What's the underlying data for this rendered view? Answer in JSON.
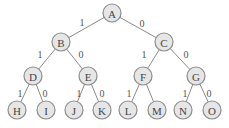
{
  "diagram": {
    "type": "binary-tree",
    "nodes": [
      {
        "id": "A",
        "label": "A",
        "x": 112,
        "y": 13
      },
      {
        "id": "B",
        "label": "B",
        "x": 61,
        "y": 42
      },
      {
        "id": "C",
        "label": "C",
        "x": 164,
        "y": 42
      },
      {
        "id": "D",
        "label": "D",
        "x": 33,
        "y": 76
      },
      {
        "id": "E",
        "label": "E",
        "x": 88,
        "y": 76
      },
      {
        "id": "F",
        "label": "F",
        "x": 143,
        "y": 76
      },
      {
        "id": "G",
        "label": "G",
        "x": 196,
        "y": 76
      },
      {
        "id": "H",
        "label": "H",
        "x": 17,
        "y": 110
      },
      {
        "id": "I",
        "label": "I",
        "x": 46,
        "y": 110
      },
      {
        "id": "J",
        "label": "J",
        "x": 74,
        "y": 110
      },
      {
        "id": "K",
        "label": "K",
        "x": 102,
        "y": 110
      },
      {
        "id": "L",
        "label": "L",
        "x": 128,
        "y": 110
      },
      {
        "id": "M",
        "label": "M",
        "x": 157,
        "y": 110
      },
      {
        "id": "N",
        "label": "N",
        "x": 183,
        "y": 110
      },
      {
        "id": "O",
        "label": "O",
        "x": 212,
        "y": 110
      }
    ],
    "edges": [
      {
        "from": "A",
        "to": "B",
        "label": "1",
        "lx": 82,
        "ly": 22
      },
      {
        "from": "A",
        "to": "C",
        "label": "0",
        "lx": 142,
        "ly": 23
      },
      {
        "from": "B",
        "to": "D",
        "label": "1",
        "lx": 40,
        "ly": 54
      },
      {
        "from": "B",
        "to": "E",
        "label": "0",
        "lx": 81,
        "ly": 54
      },
      {
        "from": "C",
        "to": "F",
        "label": "1",
        "lx": 144,
        "ly": 54
      },
      {
        "from": "C",
        "to": "G",
        "label": "0",
        "lx": 186,
        "ly": 54
      },
      {
        "from": "D",
        "to": "H",
        "label": "1",
        "lx": 20,
        "ly": 93
      },
      {
        "from": "D",
        "to": "I",
        "label": "0",
        "lx": 45,
        "ly": 93
      },
      {
        "from": "E",
        "to": "J",
        "label": "1",
        "lx": 79,
        "ly": 93
      },
      {
        "from": "E",
        "to": "K",
        "label": "0",
        "lx": 102,
        "ly": 93
      },
      {
        "from": "F",
        "to": "L",
        "label": "1",
        "lx": 129,
        "ly": 93
      },
      {
        "from": "F",
        "to": "M",
        "label": "",
        "lx": 0,
        "ly": 0
      },
      {
        "from": "G",
        "to": "N",
        "label": "1",
        "lx": 185,
        "ly": 93
      },
      {
        "from": "G",
        "to": "O",
        "label": "0",
        "lx": 209,
        "ly": 93
      }
    ],
    "node_radius": 9
  }
}
